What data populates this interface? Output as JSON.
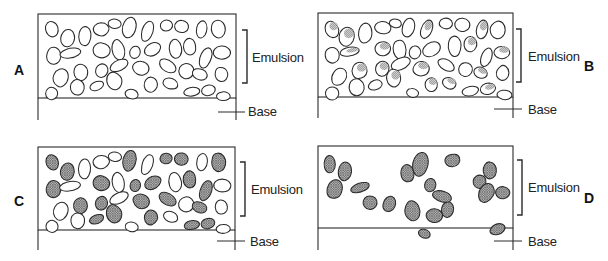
{
  "figure": {
    "colors": {
      "line": "#2a2a2a",
      "fill_shade": "#9a9a9a",
      "background": "#ffffff"
    }
  },
  "labels": {
    "emulsion": "Emulsion",
    "base": "Base"
  },
  "panels": [
    {
      "id": "A",
      "letter": "A",
      "letter_pos": [
        14,
        62
      ],
      "letter_side": "left",
      "box": {
        "x": 38,
        "y": 14,
        "w": 198,
        "h": 84,
        "base_bottom": 120
      },
      "bracket": {
        "x": 247,
        "y1": 30,
        "y2": 83
      },
      "emulsion_pos": [
        252,
        50
      ],
      "base_tick": {
        "x1": 218,
        "x2": 245,
        "y": 112
      },
      "base_pos": [
        248,
        104
      ],
      "fill_mode": "none"
    },
    {
      "id": "B",
      "letter": "B",
      "letter_pos": [
        584,
        58
      ],
      "letter_side": "right",
      "box": {
        "x": 318,
        "y": 13,
        "w": 195,
        "h": 84,
        "base_bottom": 118
      },
      "bracket": {
        "x": 521,
        "y1": 29,
        "y2": 82
      },
      "emulsion_pos": [
        528,
        49
      ],
      "base_tick": {
        "x1": 494,
        "x2": 522,
        "y": 109
      },
      "base_pos": [
        528,
        102
      ],
      "fill_mode": "partial"
    },
    {
      "id": "C",
      "letter": "C",
      "letter_pos": [
        14,
        193
      ],
      "letter_side": "left",
      "box": {
        "x": 38,
        "y": 147,
        "w": 197,
        "h": 83,
        "base_bottom": 250
      },
      "bracket": {
        "x": 245,
        "y1": 162,
        "y2": 216
      },
      "emulsion_pos": [
        251,
        182
      ],
      "base_tick": {
        "x1": 217,
        "x2": 245,
        "y": 241
      },
      "base_pos": [
        250,
        234
      ],
      "fill_mode": "mixed"
    },
    {
      "id": "D",
      "letter": "D",
      "letter_pos": [
        584,
        190
      ],
      "letter_side": "right",
      "box": {
        "x": 318,
        "y": 146,
        "w": 195,
        "h": 82,
        "base_bottom": 250
      },
      "bracket": {
        "x": 522,
        "y1": 160,
        "y2": 215
      },
      "emulsion_pos": [
        528,
        180
      ],
      "base_tick": {
        "x1": 494,
        "x2": 522,
        "y": 241
      },
      "base_pos": [
        528,
        234
      ],
      "fill_mode": "sparse"
    }
  ],
  "grains": {
    "dense": [
      [
        12,
        14,
        7,
        9,
        -20
      ],
      [
        27,
        22,
        8,
        10,
        10
      ],
      [
        45,
        19,
        7,
        11,
        5
      ],
      [
        62,
        13,
        9,
        7,
        0
      ],
      [
        75,
        8,
        7,
        5,
        10
      ],
      [
        89,
        12,
        7,
        11,
        15
      ],
      [
        107,
        15,
        6,
        11,
        20
      ],
      [
        126,
        9,
        7,
        6,
        0
      ],
      [
        142,
        10,
        8,
        7,
        5
      ],
      [
        162,
        14,
        6,
        10,
        10
      ],
      [
        178,
        14,
        8,
        10,
        0
      ],
      [
        13,
        40,
        8,
        9,
        0
      ],
      [
        30,
        37,
        11,
        5,
        -10
      ],
      [
        62,
        34,
        9,
        8,
        0
      ],
      [
        79,
        34,
        7,
        11,
        -10
      ],
      [
        95,
        37,
        6,
        7,
        15
      ],
      [
        112,
        34,
        10,
        7,
        -30
      ],
      [
        135,
        32,
        7,
        11,
        -5
      ],
      [
        150,
        30,
        7,
        9,
        0
      ],
      [
        166,
        42,
        6,
        11,
        20
      ],
      [
        182,
        37,
        9,
        7,
        0
      ],
      [
        20,
        62,
        8,
        10,
        25
      ],
      [
        40,
        56,
        8,
        9,
        0
      ],
      [
        62,
        54,
        7,
        8,
        20
      ],
      [
        80,
        49,
        11,
        6,
        -25
      ],
      [
        101,
        53,
        9,
        8,
        10
      ],
      [
        127,
        50,
        10,
        6,
        30
      ],
      [
        146,
        55,
        8,
        8,
        0
      ],
      [
        160,
        58,
        8,
        6,
        20
      ],
      [
        182,
        58,
        7,
        8,
        0
      ],
      [
        12,
        78,
        7,
        7,
        15
      ],
      [
        37,
        72,
        8,
        9,
        0
      ],
      [
        56,
        70,
        8,
        5,
        -20
      ],
      [
        74,
        64,
        8,
        10,
        -10
      ],
      [
        92,
        78,
        7,
        5,
        10
      ],
      [
        111,
        69,
        7,
        8,
        0
      ],
      [
        130,
        68,
        8,
        6,
        20
      ],
      [
        151,
        76,
        9,
        5,
        -10
      ],
      [
        168,
        74,
        8,
        6,
        -15
      ],
      [
        184,
        80,
        8,
        5,
        0
      ]
    ],
    "sparse": [
      [
        10,
        16,
        6,
        9,
        0
      ],
      [
        25,
        24,
        7,
        10,
        5
      ],
      [
        14,
        42,
        8,
        11,
        20
      ],
      [
        39,
        40,
        11,
        5,
        -20
      ],
      [
        50,
        54,
        8,
        8,
        0
      ],
      [
        70,
        56,
        7,
        9,
        20
      ],
      [
        88,
        26,
        7,
        10,
        -10
      ],
      [
        100,
        17,
        8,
        13,
        15
      ],
      [
        110,
        37,
        6,
        7,
        10
      ],
      [
        92,
        62,
        8,
        11,
        -15
      ],
      [
        115,
        67,
        9,
        8,
        0
      ],
      [
        128,
        62,
        7,
        9,
        10
      ],
      [
        104,
        86,
        7,
        5,
        20
      ],
      [
        121,
        48,
        11,
        6,
        20
      ],
      [
        132,
        12,
        8,
        7,
        -10
      ],
      [
        170,
        22,
        7,
        9,
        0
      ],
      [
        160,
        34,
        7,
        7,
        0
      ],
      [
        166,
        46,
        8,
        11,
        20
      ],
      [
        182,
        45,
        8,
        7,
        0
      ],
      [
        177,
        81,
        9,
        6,
        -20
      ]
    ]
  },
  "fill_patterns": {
    "partial": [
      1,
      1,
      0,
      0,
      0,
      0,
      1,
      0,
      0,
      1,
      0,
      0,
      1,
      1,
      0,
      0,
      0,
      0,
      1,
      0,
      1,
      0,
      1,
      1,
      0,
      1,
      0,
      0,
      1,
      0,
      0,
      0,
      0,
      1,
      0,
      1,
      1,
      0,
      1,
      0
    ],
    "mixed": [
      1,
      1,
      0,
      0,
      0,
      1,
      0,
      1,
      1,
      0,
      1,
      1,
      0,
      1,
      0,
      1,
      1,
      0,
      1,
      1,
      0,
      0,
      1,
      1,
      0,
      1,
      1,
      0,
      1,
      0,
      0,
      0,
      1,
      1,
      0,
      1,
      0,
      1,
      1,
      0
    ]
  }
}
